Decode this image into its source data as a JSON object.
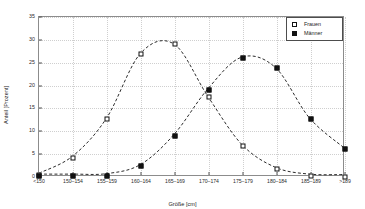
{
  "chart_data": {
    "type": "line",
    "title": "",
    "xlabel": "Größe [cm]",
    "ylabel": "Anteil [Prozent]",
    "categories": [
      "<150",
      "150–154",
      "155–159",
      "160–164",
      "165–169",
      "170–174",
      "175–179",
      "180–184",
      "185–189",
      ">189"
    ],
    "ylim": [
      0,
      35
    ],
    "yticks": [
      0,
      5,
      10,
      15,
      20,
      25,
      30,
      35
    ],
    "ytick_labels": [
      "0",
      "5",
      "10",
      "15",
      "20",
      "25",
      "30",
      "35"
    ],
    "grid": true,
    "legend_position": "top-right",
    "series": [
      {
        "name": "Frauen",
        "marker": "open-square",
        "linestyle": "dashed",
        "color": "#111111",
        "values": [
          0.4,
          4.2,
          12.6,
          26.9,
          29.0,
          17.4,
          6.8,
          1.7,
          0.2,
          0.1
        ]
      },
      {
        "name": "Männer",
        "marker": "filled-square",
        "linestyle": "dashed",
        "color": "#111111",
        "values": [
          0.2,
          0.2,
          0.3,
          2.3,
          9.0,
          19.1,
          26.1,
          23.8,
          12.7,
          6.2
        ]
      }
    ]
  },
  "legend": {
    "entries": [
      {
        "label": "Frauen",
        "swatch": "open-square"
      },
      {
        "label": "Männer",
        "swatch": "filled-square"
      }
    ]
  }
}
